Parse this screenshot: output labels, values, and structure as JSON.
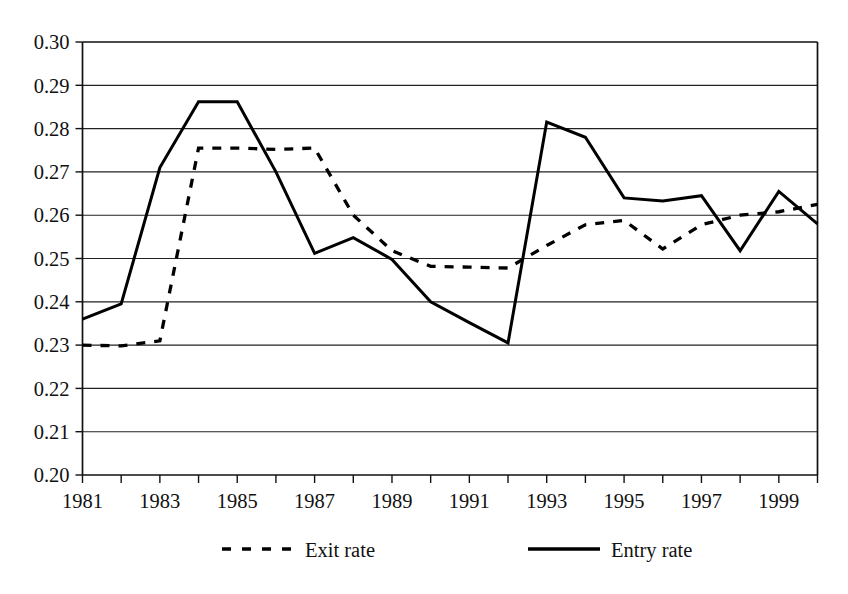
{
  "chart_data": {
    "type": "line",
    "title": "",
    "subtitle": "",
    "xlabel": "",
    "ylabel": "",
    "xlim": [
      1981,
      2000
    ],
    "ylim": [
      0.2,
      0.3
    ],
    "grid": true,
    "legend_position": "bottom",
    "x": [
      1981,
      1982,
      1983,
      1984,
      1985,
      1986,
      1987,
      1988,
      1989,
      1990,
      1991,
      1992,
      1993,
      1994,
      1995,
      1996,
      1997,
      1998,
      1999,
      2000
    ],
    "xtick_labels": [
      "1981",
      "1983",
      "1985",
      "1987",
      "1989",
      "1991",
      "1993",
      "1995",
      "1997",
      "1999"
    ],
    "xtick_values": [
      1981,
      1983,
      1985,
      1987,
      1989,
      1991,
      1993,
      1995,
      1997,
      1999
    ],
    "ytick_labels": [
      "0.20",
      "0.21",
      "0.22",
      "0.23",
      "0.24",
      "0.25",
      "0.26",
      "0.27",
      "0.28",
      "0.29",
      "0.30"
    ],
    "ytick_values": [
      0.2,
      0.21,
      0.22,
      0.23,
      0.24,
      0.25,
      0.26,
      0.27,
      0.28,
      0.29,
      0.3
    ],
    "series": [
      {
        "name": "Exit rate",
        "style": "dashed",
        "color": "#000000",
        "values": [
          0.23,
          0.2298,
          0.231,
          0.2755,
          0.2755,
          0.2752,
          0.2755,
          0.26,
          0.2518,
          0.2482,
          0.248,
          0.2478,
          0.253,
          0.2578,
          0.2588,
          0.2522,
          0.2578,
          0.26,
          0.2608,
          0.2625
        ]
      },
      {
        "name": "Entry rate",
        "style": "solid",
        "color": "#000000",
        "values": [
          0.236,
          0.2395,
          0.271,
          0.2862,
          0.2862,
          0.27,
          0.2512,
          0.2548,
          0.2498,
          0.24,
          0.2352,
          0.2305,
          0.2815,
          0.278,
          0.264,
          0.2633,
          0.2645,
          0.2518,
          0.2655,
          0.258
        ]
      }
    ]
  },
  "legend": {
    "items": [
      {
        "label": "Exit rate",
        "style": "dashed"
      },
      {
        "label": "Entry rate",
        "style": "solid"
      }
    ]
  }
}
